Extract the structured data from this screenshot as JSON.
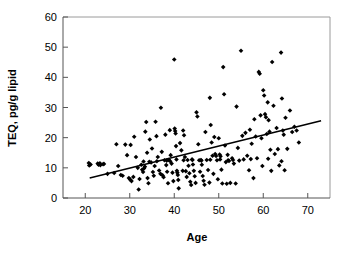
{
  "chart_data": {
    "type": "scatter",
    "title": "",
    "xlabel": "Age",
    "ylabel": "TEQ, pg/g lipid",
    "xlim": [
      15,
      75
    ],
    "ylim": [
      0,
      60
    ],
    "xticks": [
      20,
      30,
      40,
      50,
      60,
      70
    ],
    "yticks": [
      0,
      10,
      20,
      30,
      40,
      50,
      60
    ],
    "grid": false,
    "legend": null,
    "marker": "filled-diamond",
    "marker_color": "#000000",
    "trendline": {
      "name": "linear regression",
      "color": "#000000",
      "x_start": 21.0,
      "y_start": 6.6,
      "x_end": 73.0,
      "y_end": 25.6,
      "slope": 0.365,
      "intercept": -1.07
    },
    "points": [
      [
        20.8,
        11.6
      ],
      [
        20.9,
        10.8
      ],
      [
        21.2,
        11.1
      ],
      [
        22.8,
        11.4
      ],
      [
        23.0,
        11.0
      ],
      [
        23.3,
        11.5
      ],
      [
        23.4,
        10.9
      ],
      [
        24.0,
        11.2
      ],
      [
        25.0,
        8.0
      ],
      [
        26.5,
        8.3
      ],
      [
        27.0,
        17.8
      ],
      [
        27.4,
        10.6
      ],
      [
        28.0,
        7.6
      ],
      [
        28.4,
        7.4
      ],
      [
        29.0,
        17.7
      ],
      [
        29.4,
        14.2
      ],
      [
        29.8,
        6.6
      ],
      [
        30.1,
        6.1
      ],
      [
        30.4,
        5.6
      ],
      [
        30.8,
        7.0
      ],
      [
        31.0,
        20.3
      ],
      [
        31.4,
        13.6
      ],
      [
        31.8,
        10.0
      ],
      [
        32.0,
        2.8
      ],
      [
        32.2,
        6.3
      ],
      [
        32.6,
        11.0
      ],
      [
        32.8,
        9.4
      ],
      [
        33.0,
        8.6
      ],
      [
        33.2,
        9.8
      ],
      [
        33.4,
        10.4
      ],
      [
        33.5,
        22.0
      ],
      [
        33.7,
        25.2
      ],
      [
        33.9,
        15.0
      ],
      [
        34.0,
        6.6
      ],
      [
        34.2,
        4.9
      ],
      [
        34.5,
        19.4
      ],
      [
        34.8,
        11.8
      ],
      [
        35.0,
        16.4
      ],
      [
        35.2,
        8.6
      ],
      [
        35.4,
        7.4
      ],
      [
        35.6,
        10.6
      ],
      [
        35.8,
        25.3
      ],
      [
        36.0,
        20.5
      ],
      [
        36.3,
        13.6
      ],
      [
        36.6,
        9.1
      ],
      [
        36.9,
        8.0
      ],
      [
        37.0,
        29.9
      ],
      [
        37.2,
        15.3
      ],
      [
        37.4,
        7.5
      ],
      [
        37.6,
        6.9
      ],
      [
        37.8,
        12.5
      ],
      [
        38.0,
        21.0
      ],
      [
        38.2,
        10.9
      ],
      [
        38.4,
        8.7
      ],
      [
        38.6,
        4.9
      ],
      [
        38.8,
        12.6
      ],
      [
        39.0,
        22.5
      ],
      [
        39.2,
        14.2
      ],
      [
        39.4,
        11.4
      ],
      [
        39.6,
        8.4
      ],
      [
        39.8,
        5.6
      ],
      [
        40.0,
        45.9
      ],
      [
        40.1,
        23.0
      ],
      [
        40.2,
        22.2
      ],
      [
        40.3,
        21.4
      ],
      [
        40.4,
        17.2
      ],
      [
        40.5,
        12.8
      ],
      [
        40.6,
        9.0
      ],
      [
        40.7,
        8.4
      ],
      [
        40.8,
        7.6
      ],
      [
        40.9,
        6.0
      ],
      [
        41.0,
        3.2
      ],
      [
        41.3,
        18.2
      ],
      [
        41.6,
        15.8
      ],
      [
        41.9,
        9.0
      ],
      [
        42.0,
        22.4
      ],
      [
        42.2,
        20.8
      ],
      [
        42.4,
        13.6
      ],
      [
        42.6,
        8.9
      ],
      [
        42.8,
        7.0
      ],
      [
        43.0,
        12.6
      ],
      [
        43.2,
        10.7
      ],
      [
        43.4,
        8.2
      ],
      [
        43.6,
        5.4
      ],
      [
        43.8,
        4.3
      ],
      [
        44.0,
        12.8
      ],
      [
        44.2,
        11.1
      ],
      [
        44.4,
        9.0
      ],
      [
        44.6,
        7.2
      ],
      [
        44.8,
        5.0
      ],
      [
        45.0,
        28.4
      ],
      [
        45.2,
        27.0
      ],
      [
        45.4,
        17.8
      ],
      [
        45.6,
        12.5
      ],
      [
        45.8,
        8.7
      ],
      [
        46.0,
        12.6
      ],
      [
        46.2,
        11.0
      ],
      [
        46.4,
        7.3
      ],
      [
        46.6,
        5.7
      ],
      [
        46.8,
        4.4
      ],
      [
        47.0,
        21.9
      ],
      [
        47.3,
        12.6
      ],
      [
        47.6,
        9.3
      ],
      [
        47.9,
        5.1
      ],
      [
        48.0,
        33.2
      ],
      [
        48.2,
        24.2
      ],
      [
        48.4,
        18.4
      ],
      [
        48.6,
        14.0
      ],
      [
        48.8,
        8.0
      ],
      [
        49.0,
        20.2
      ],
      [
        49.2,
        14.6
      ],
      [
        49.4,
        13.9
      ],
      [
        49.6,
        12.5
      ],
      [
        49.8,
        6.2
      ],
      [
        50.0,
        19.8
      ],
      [
        50.2,
        14.4
      ],
      [
        50.4,
        13.8
      ],
      [
        50.6,
        9.4
      ],
      [
        50.8,
        4.8
      ],
      [
        51.0,
        43.4
      ],
      [
        51.2,
        34.4
      ],
      [
        51.4,
        17.4
      ],
      [
        51.6,
        11.9
      ],
      [
        51.8,
        4.7
      ],
      [
        52.0,
        14.3
      ],
      [
        52.3,
        12.3
      ],
      [
        52.6,
        5.0
      ],
      [
        53.0,
        13.2
      ],
      [
        53.4,
        11.4
      ],
      [
        53.8,
        4.8
      ],
      [
        54.0,
        30.3
      ],
      [
        54.3,
        16.6
      ],
      [
        54.6,
        12.4
      ],
      [
        55.0,
        48.8
      ],
      [
        55.3,
        20.6
      ],
      [
        55.6,
        12.8
      ],
      [
        56.0,
        21.6
      ],
      [
        56.4,
        14.0
      ],
      [
        56.8,
        9.2
      ],
      [
        57.0,
        22.6
      ],
      [
        57.4,
        18.0
      ],
      [
        57.8,
        6.6
      ],
      [
        58.0,
        26.1
      ],
      [
        58.3,
        20.4
      ],
      [
        58.6,
        13.2
      ],
      [
        59.0,
        41.8
      ],
      [
        59.2,
        41.2
      ],
      [
        59.4,
        27.4
      ],
      [
        59.6,
        19.8
      ],
      [
        59.8,
        10.6
      ],
      [
        60.0,
        35.7
      ],
      [
        60.2,
        34.0
      ],
      [
        60.4,
        27.8
      ],
      [
        60.6,
        26.8
      ],
      [
        60.8,
        21.2
      ],
      [
        61.0,
        31.7
      ],
      [
        61.2,
        25.8
      ],
      [
        61.4,
        22.0
      ],
      [
        61.6,
        16.0
      ],
      [
        61.8,
        9.0
      ],
      [
        62.0,
        45.1
      ],
      [
        62.3,
        30.6
      ],
      [
        62.6,
        14.6
      ],
      [
        63.0,
        23.2
      ],
      [
        63.3,
        16.2
      ],
      [
        63.6,
        10.8
      ],
      [
        64.0,
        48.2
      ],
      [
        64.2,
        33.0
      ],
      [
        64.4,
        22.4
      ],
      [
        64.6,
        21.0
      ],
      [
        64.8,
        9.2
      ],
      [
        65.0,
        26.6
      ],
      [
        65.4,
        16.3
      ],
      [
        66.0,
        29.0
      ],
      [
        66.5,
        21.9
      ],
      [
        67.0,
        23.6
      ],
      [
        67.5,
        22.4
      ],
      [
        68.0,
        18.4
      ],
      [
        24.2,
        11.3
      ],
      [
        30.2,
        17.6
      ],
      [
        34.4,
        12.0
      ],
      [
        38.3,
        12.4
      ],
      [
        42.1,
        12.5
      ],
      [
        46.1,
        12.4
      ],
      [
        50.3,
        12.8
      ],
      [
        53.2,
        12.6
      ],
      [
        57.2,
        12.9
      ],
      [
        61.1,
        13.0
      ],
      [
        64.1,
        12.2
      ],
      [
        36.1,
        12.2
      ],
      [
        39.1,
        12.2
      ],
      [
        33.1,
        12.1
      ],
      [
        44.1,
        12.6
      ],
      [
        48.1,
        12.7
      ],
      [
        52.1,
        12.5
      ]
    ]
  }
}
